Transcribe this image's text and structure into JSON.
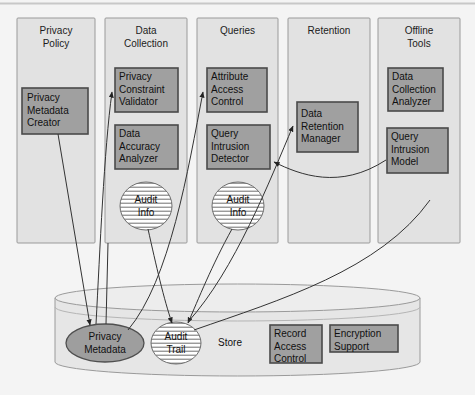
{
  "diagram": {
    "type": "block-architecture",
    "colors": {
      "page_background": "#f4f4f4",
      "column_fill": "#e2e2e2",
      "column_stroke": "#9a9a9a",
      "component_fill": "#a0a0a0",
      "component_stroke": "#4a4a4a",
      "cylinder_fill": "#e6e6e6",
      "cylinder_stroke": "#9a9a9a",
      "metadata_ellipse_fill": "#9e9e9e",
      "hatched_ellipse_fill": "#ffffff",
      "arrow_stroke": "#333333",
      "text": "#101010"
    },
    "columns": [
      {
        "id": "privacy-policy",
        "title": "Privacy\nPolicy",
        "x": 17,
        "y": 18,
        "w": 78,
        "h": 225
      },
      {
        "id": "data-collection",
        "title": "Data\nCollection",
        "x": 105,
        "y": 18,
        "w": 82,
        "h": 225
      },
      {
        "id": "queries",
        "title": "Queries",
        "x": 197,
        "y": 18,
        "w": 81,
        "h": 225
      },
      {
        "id": "retention",
        "title": "Retention",
        "x": 288,
        "y": 18,
        "w": 82,
        "h": 225
      },
      {
        "id": "offline-tools",
        "title": "Offline\nTools",
        "x": 378,
        "y": 18,
        "w": 82,
        "h": 225
      }
    ],
    "components": [
      {
        "id": "privacy-metadata-creator",
        "label": "Privacy\nMetadata\nCreator",
        "column": "privacy-policy",
        "x": 22,
        "y": 88,
        "w": 66,
        "h": 46
      },
      {
        "id": "privacy-constraint-validator",
        "label": "Privacy\nConstraint\nValidator",
        "column": "data-collection",
        "x": 115,
        "y": 68,
        "w": 63,
        "h": 44
      },
      {
        "id": "data-accuracy-analyzer",
        "label": "Data\nAccuracy\nAnalyzer",
        "column": "data-collection",
        "x": 115,
        "y": 125,
        "w": 63,
        "h": 44
      },
      {
        "id": "attribute-access-control",
        "label": "Attribute\nAccess\nControl",
        "column": "queries",
        "x": 207,
        "y": 68,
        "w": 60,
        "h": 44
      },
      {
        "id": "query-intrusion-detector",
        "label": "Query\nIntrusion\nDetector",
        "column": "queries",
        "x": 207,
        "y": 125,
        "w": 63,
        "h": 44
      },
      {
        "id": "data-retention-manager",
        "label": "Data\nRetention\nManager",
        "column": "retention",
        "x": 297,
        "y": 102,
        "w": 61,
        "h": 50
      },
      {
        "id": "data-collection-analyzer",
        "label": "Data\nCollection\nAnalyzer",
        "column": "offline-tools",
        "x": 388,
        "y": 68,
        "w": 55,
        "h": 43
      },
      {
        "id": "query-intrusion-model",
        "label": "Query\nIntrusion\nModel",
        "column": "offline-tools",
        "x": 387,
        "y": 128,
        "w": 61,
        "h": 45
      },
      {
        "id": "record-access-control",
        "label": "Record\nAccess\nControl",
        "column": "store",
        "x": 270,
        "y": 325,
        "w": 52,
        "h": 38
      },
      {
        "id": "encryption-support",
        "label": "Encryption\nSupport",
        "column": "store",
        "x": 330,
        "y": 325,
        "w": 68,
        "h": 27
      }
    ],
    "ellipses": [
      {
        "id": "audit-info-data-collection",
        "label": "Audit\nInfo",
        "cx": 146,
        "cy": 206,
        "rx": 26,
        "ry": 24,
        "style": "hatched"
      },
      {
        "id": "audit-info-queries",
        "label": "Audit\nInfo",
        "cx": 238,
        "cy": 206,
        "rx": 26,
        "ry": 24,
        "style": "hatched"
      },
      {
        "id": "privacy-metadata",
        "label": "Privacy\nMetadata",
        "cx": 105,
        "cy": 343,
        "rx": 39,
        "ry": 19,
        "style": "solid"
      },
      {
        "id": "audit-trail",
        "label": "Audit\nTrail",
        "cx": 176,
        "cy": 343,
        "rx": 25,
        "ry": 21,
        "style": "hatched"
      }
    ],
    "store": {
      "id": "store-cylinder",
      "label": "Store",
      "label_x": 227,
      "label_y": 338,
      "x": 55,
      "y": 288,
      "w": 365,
      "h": 88,
      "ellipse_ry": 14
    }
  }
}
